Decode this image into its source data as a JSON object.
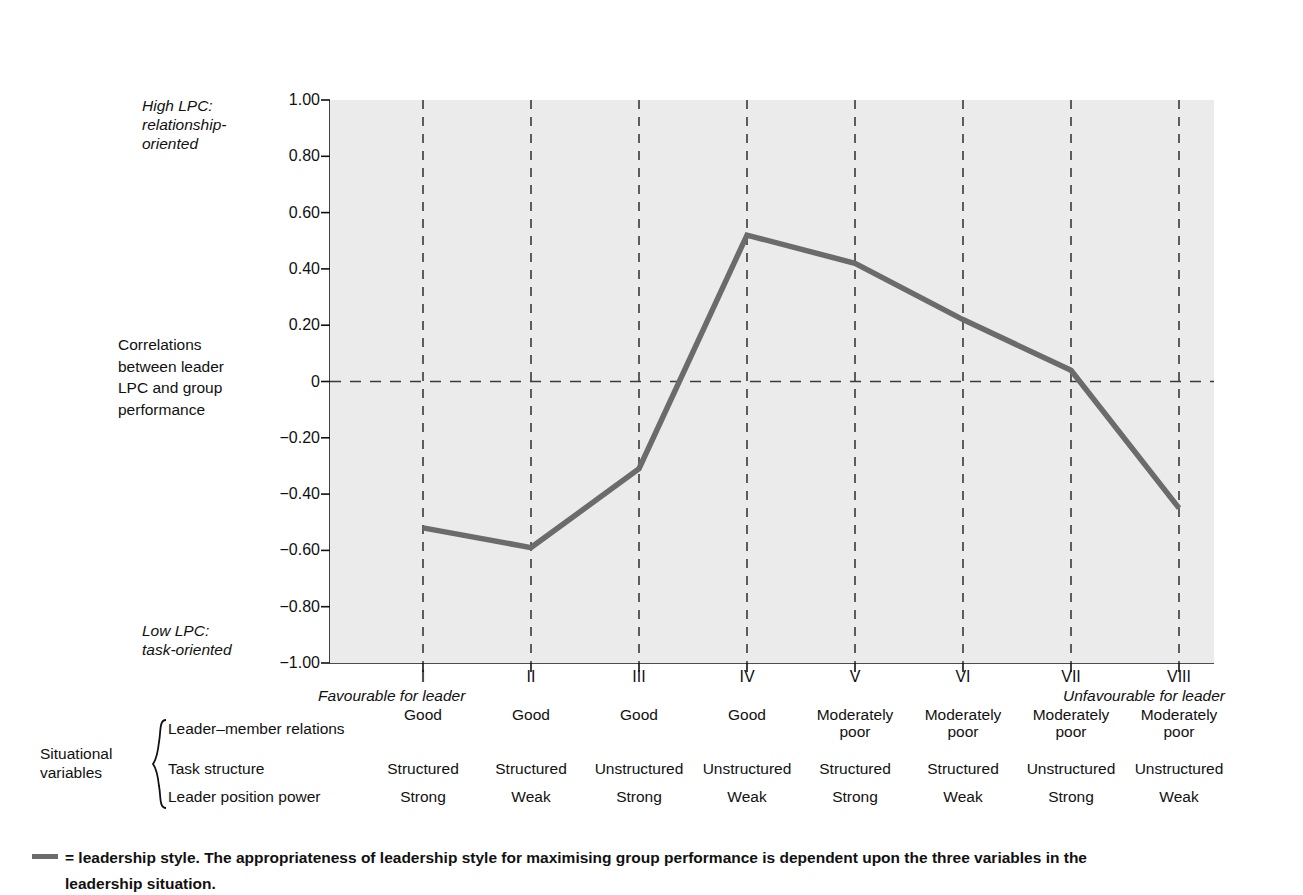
{
  "axis": {
    "y_label_high": "High LPC:\nrelationship-\noriented",
    "y_label_low": "Low LPC:\ntask-oriented",
    "y_label_main": "Correlations\nbetween leader\nLPC and group\nperformance",
    "favourable_note": "Favourable for leader",
    "unfavourable_note": "Unfavourable for leader"
  },
  "situational": {
    "title": "Situational\nvariables",
    "rows": [
      {
        "label": "Leader–member relations"
      },
      {
        "label": "Task structure"
      },
      {
        "label": "Leader position power"
      }
    ]
  },
  "caption": {
    "line1": "= leadership style.   The appropriateness of leadership style for maximising group performance is dependent upon the three variables in the",
    "line2": "leadership situation."
  },
  "chart_data": {
    "type": "line",
    "title": "",
    "xlabel": "",
    "ylabel": "Correlations between leader LPC and group performance",
    "ylim": [
      -1.0,
      1.0
    ],
    "xlim": [
      0.5,
      8.5
    ],
    "grid": true,
    "legend_position": "below",
    "legend_entries": [
      "leadership style"
    ],
    "line_color": "#6b6b6b",
    "plot_bg_color": "#ebebeb",
    "zero_line": 0,
    "yticks": [
      1.0,
      0.8,
      0.6,
      0.4,
      0.2,
      0,
      -0.2,
      -0.4,
      -0.6,
      -0.8,
      -1.0
    ],
    "ytick_labels": [
      "1.00",
      "0.80",
      "0.60",
      "0.40",
      "0.20",
      "0",
      "−0.20",
      "−0.40",
      "−0.60",
      "−0.80",
      "−1.00"
    ],
    "categories": [
      "I",
      "II",
      "III",
      "IV",
      "V",
      "VI",
      "VII",
      "VIII"
    ],
    "values": [
      -0.52,
      -0.59,
      -0.31,
      0.52,
      0.42,
      0.22,
      0.04,
      -0.45
    ],
    "series": [
      {
        "name": "leadership style",
        "values": [
          -0.52,
          -0.59,
          -0.31,
          0.52,
          0.42,
          0.22,
          0.04,
          -0.45
        ]
      }
    ],
    "table": {
      "row_labels": [
        "Leader–member relations",
        "Task structure",
        "Leader position power"
      ],
      "columns": [
        "I",
        "II",
        "III",
        "IV",
        "V",
        "VI",
        "VII",
        "VIII"
      ],
      "rows": [
        [
          "Good",
          "Good",
          "Good",
          "Good",
          "Moderately\npoor",
          "Moderately\npoor",
          "Moderately\npoor",
          "Moderately\npoor"
        ],
        [
          "Structured",
          "Structured",
          "Unstructured",
          "Unstructured",
          "Structured",
          "Structured",
          "Unstructured",
          "Unstructured"
        ],
        [
          "Strong",
          "Weak",
          "Strong",
          "Weak",
          "Strong",
          "Weak",
          "Strong",
          "Weak"
        ]
      ]
    }
  }
}
